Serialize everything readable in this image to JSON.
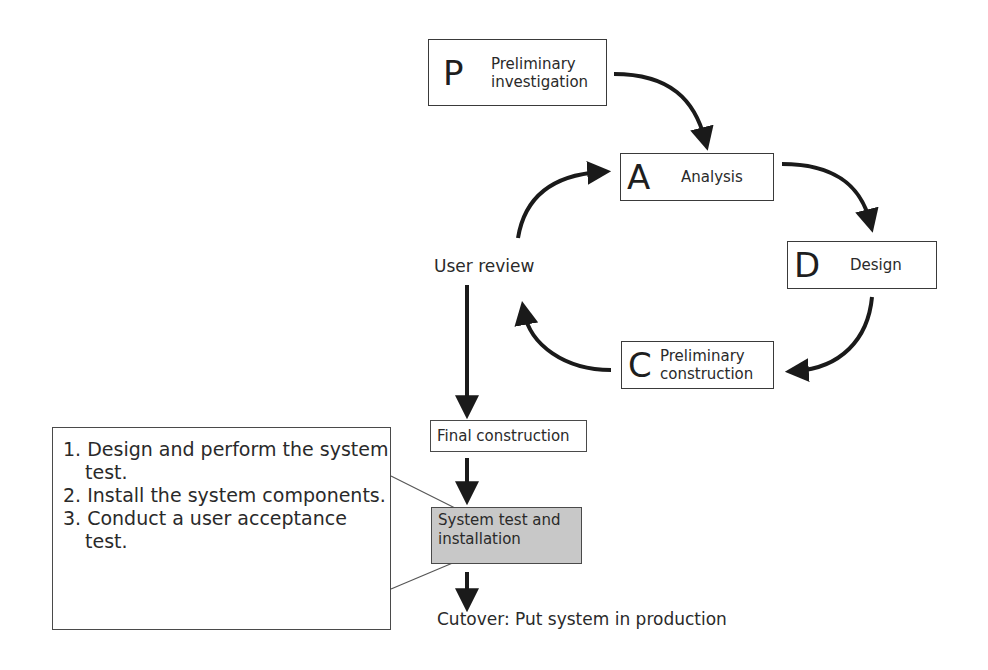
{
  "diagram": {
    "type": "systems-development-cycle",
    "colors": {
      "stroke": "#1a1a1a",
      "box_border": "#3a3a3a",
      "highlight_fill": "#c8c8c8",
      "text": "#2a2a2a"
    },
    "phases": [
      {
        "id": "P",
        "letter": "P",
        "label": "Preliminary investigation"
      },
      {
        "id": "A",
        "letter": "A",
        "label": "Analysis"
      },
      {
        "id": "D",
        "letter": "D",
        "label": "Design"
      },
      {
        "id": "C",
        "letter": "C",
        "label": "Preliminary construction"
      }
    ],
    "user_review": {
      "label": "User review"
    },
    "steps": [
      {
        "id": "final",
        "label": "Final construction",
        "highlighted": false
      },
      {
        "id": "systest",
        "label": "System test and installation",
        "highlighted": true
      }
    ],
    "cutover": {
      "label": "Cutover: Put system in production"
    },
    "callout": {
      "items": [
        {
          "number": "1.",
          "text": "Design and perform the system test."
        },
        {
          "number": "2.",
          "text": "Install the system components."
        },
        {
          "number": "3.",
          "text": "Conduct a user acceptance test."
        }
      ]
    },
    "edges": [
      {
        "from": "P",
        "to": "A",
        "style": "curved-arrow"
      },
      {
        "from": "A",
        "to": "D",
        "style": "curved-arrow"
      },
      {
        "from": "D",
        "to": "C",
        "style": "curved-arrow"
      },
      {
        "from": "C",
        "to": "user_review",
        "style": "curved-arrow"
      },
      {
        "from": "user_review",
        "to": "A",
        "style": "curved-arrow"
      },
      {
        "from": "user_review",
        "to": "final",
        "style": "straight-arrow"
      },
      {
        "from": "final",
        "to": "systest",
        "style": "straight-arrow"
      },
      {
        "from": "systest",
        "to": "cutover",
        "style": "straight-arrow"
      }
    ]
  }
}
